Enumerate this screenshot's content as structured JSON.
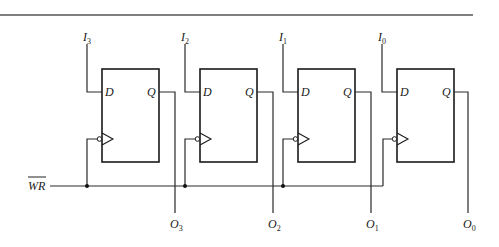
{
  "diagram": {
    "control_signal": {
      "label": "WR",
      "overline": true
    },
    "flip_flops": [
      {
        "input": {
          "base": "I",
          "sub": "3"
        },
        "output": {
          "base": "O",
          "sub": "3"
        },
        "d_label": "D",
        "q_label": "Q"
      },
      {
        "input": {
          "base": "I",
          "sub": "2"
        },
        "output": {
          "base": "O",
          "sub": "2"
        },
        "d_label": "D",
        "q_label": "Q"
      },
      {
        "input": {
          "base": "I",
          "sub": "1"
        },
        "output": {
          "base": "O",
          "sub": "1"
        },
        "d_label": "D",
        "q_label": "Q"
      },
      {
        "input": {
          "base": "I",
          "sub": "0"
        },
        "output": {
          "base": "O",
          "sub": "0"
        },
        "d_label": "D",
        "q_label": "Q"
      }
    ],
    "colors": {
      "line": "#2a2a2a",
      "rule": "#555555",
      "background": "#ffffff"
    }
  }
}
